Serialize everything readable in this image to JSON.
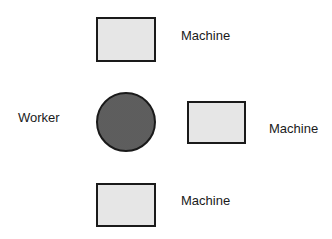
{
  "diagram": {
    "worker": {
      "label": "Worker",
      "shape": "circle"
    },
    "machines": [
      {
        "label": "Machine",
        "position": "top"
      },
      {
        "label": "Machine",
        "position": "right"
      },
      {
        "label": "Machine",
        "position": "bottom"
      }
    ]
  }
}
